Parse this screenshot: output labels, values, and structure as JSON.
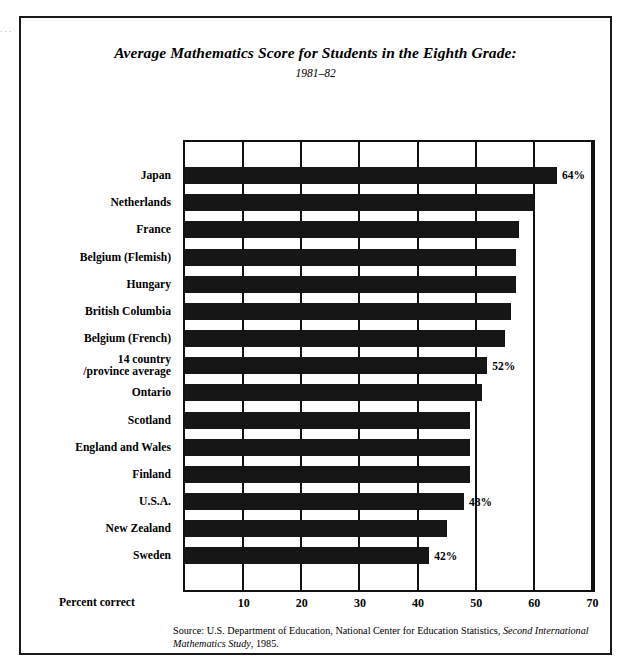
{
  "figure": {
    "title": "Average Mathematics Score for Students in the Eighth Grade:",
    "subtitle": "1981–82",
    "margin_sliver": "· · · · ·",
    "source_prefix": "Source: U.S. Department of Education, National Center for Education Statistics, ",
    "source_italic": "Second International Mathematics Study",
    "source_suffix": ", 1985."
  },
  "chart_data": {
    "type": "bar",
    "orientation": "horizontal",
    "title": "Average Mathematics Score for Students in the Eighth Grade:",
    "subtitle": "1981–82",
    "xlabel": "Percent correct",
    "ylabel": "",
    "xlim": [
      0,
      70
    ],
    "xticks": [
      10,
      20,
      30,
      40,
      50,
      60,
      70
    ],
    "xtick_labels": [
      "10",
      "20",
      "30",
      "40",
      "50",
      "60",
      "70"
    ],
    "grid": true,
    "legend": false,
    "units": "percent correct",
    "categories": [
      "Japan",
      "Netherlands",
      "France",
      "Belgium (Flemish)",
      "Hungary",
      "British Columbia",
      "Belgium (French)",
      "14 country /province average",
      "Ontario",
      "Scotland",
      "England and Wales",
      "Finland",
      "U.S.A.",
      "New Zealand",
      "Sweden"
    ],
    "values": [
      64,
      60,
      57.5,
      57,
      57,
      56,
      55,
      52,
      51,
      49,
      49,
      49,
      48,
      45,
      42
    ],
    "data_labels": [
      "64%",
      "",
      "",
      "",
      "",
      "",
      "",
      "52%",
      "",
      "",
      "",
      "",
      "48%",
      "",
      "42%"
    ]
  },
  "categories_display": [
    {
      "line1": "Japan",
      "line2": ""
    },
    {
      "line1": "Netherlands",
      "line2": ""
    },
    {
      "line1": "France",
      "line2": ""
    },
    {
      "line1": "Belgium (Flemish)",
      "line2": ""
    },
    {
      "line1": "Hungary",
      "line2": ""
    },
    {
      "line1": "British Columbia",
      "line2": ""
    },
    {
      "line1": "Belgium (French)",
      "line2": ""
    },
    {
      "line1": "14 country",
      "line2": "/province average"
    },
    {
      "line1": "Ontario",
      "line2": ""
    },
    {
      "line1": "Scotland",
      "line2": ""
    },
    {
      "line1": "England and Wales",
      "line2": ""
    },
    {
      "line1": "Finland",
      "line2": ""
    },
    {
      "line1": "U.S.A.",
      "line2": ""
    },
    {
      "line1": "New Zealand",
      "line2": ""
    },
    {
      "line1": "Sweden",
      "line2": ""
    }
  ],
  "colors": {
    "bar": "#161616",
    "frame": "#1a1a1a",
    "grid": "#111111",
    "background": "#ffffff"
  }
}
